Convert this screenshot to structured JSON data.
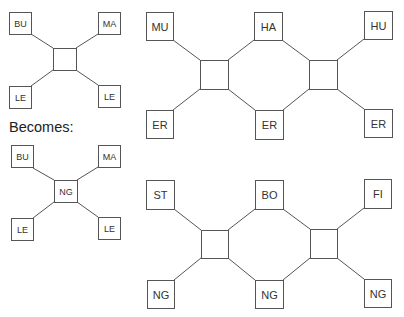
{
  "caption": "Becomes:",
  "colors": {
    "line": "#555555",
    "text": "#222222",
    "background": "#ffffff"
  },
  "diagrams": {
    "before_small": {
      "hub": "",
      "nodes": [
        "BU",
        "MA",
        "LE",
        "LE"
      ]
    },
    "after_small": {
      "hub": "NG",
      "nodes": [
        "BU",
        "MA",
        "LE",
        "LE"
      ]
    },
    "chain_top": {
      "hubs": [
        "",
        ""
      ],
      "top": [
        "MU",
        "HA",
        "HU"
      ],
      "bottom": [
        "ER",
        "ER",
        "ER"
      ]
    },
    "chain_bottom": {
      "hubs": [
        "",
        ""
      ],
      "top": [
        "ST",
        "BO",
        "FI"
      ],
      "bottom": [
        "NG",
        "NG",
        "NG"
      ]
    }
  }
}
